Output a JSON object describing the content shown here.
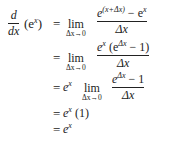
{
  "derivation": {
    "lhs": {
      "d": "d",
      "dx": "dx",
      "func": "(e",
      "func_sup": "x",
      "func_close": ")"
    },
    "eq": "=",
    "lim_word": "lim",
    "lim_sub": "Δx→0",
    "line1": {
      "num_base": "e",
      "num_sup": "(x+Δx)",
      "num_rest": " − e",
      "num_rest_sup": "x",
      "den": "Δx"
    },
    "line2": {
      "num_base": "e",
      "num_sup": "x",
      "num_mid": " (e",
      "num_mid_sup": "Δx",
      "num_rest": " − 1)",
      "den": "Δx"
    },
    "line3": {
      "pre": "e",
      "pre_sup": "x",
      "num_base": "e",
      "num_sup": "Δx",
      "num_rest": " − 1",
      "den": "Δx"
    },
    "line4": {
      "base": "e",
      "sup": "x",
      "rest": " (1)"
    },
    "line5": {
      "base": "e",
      "sup": "x"
    }
  }
}
